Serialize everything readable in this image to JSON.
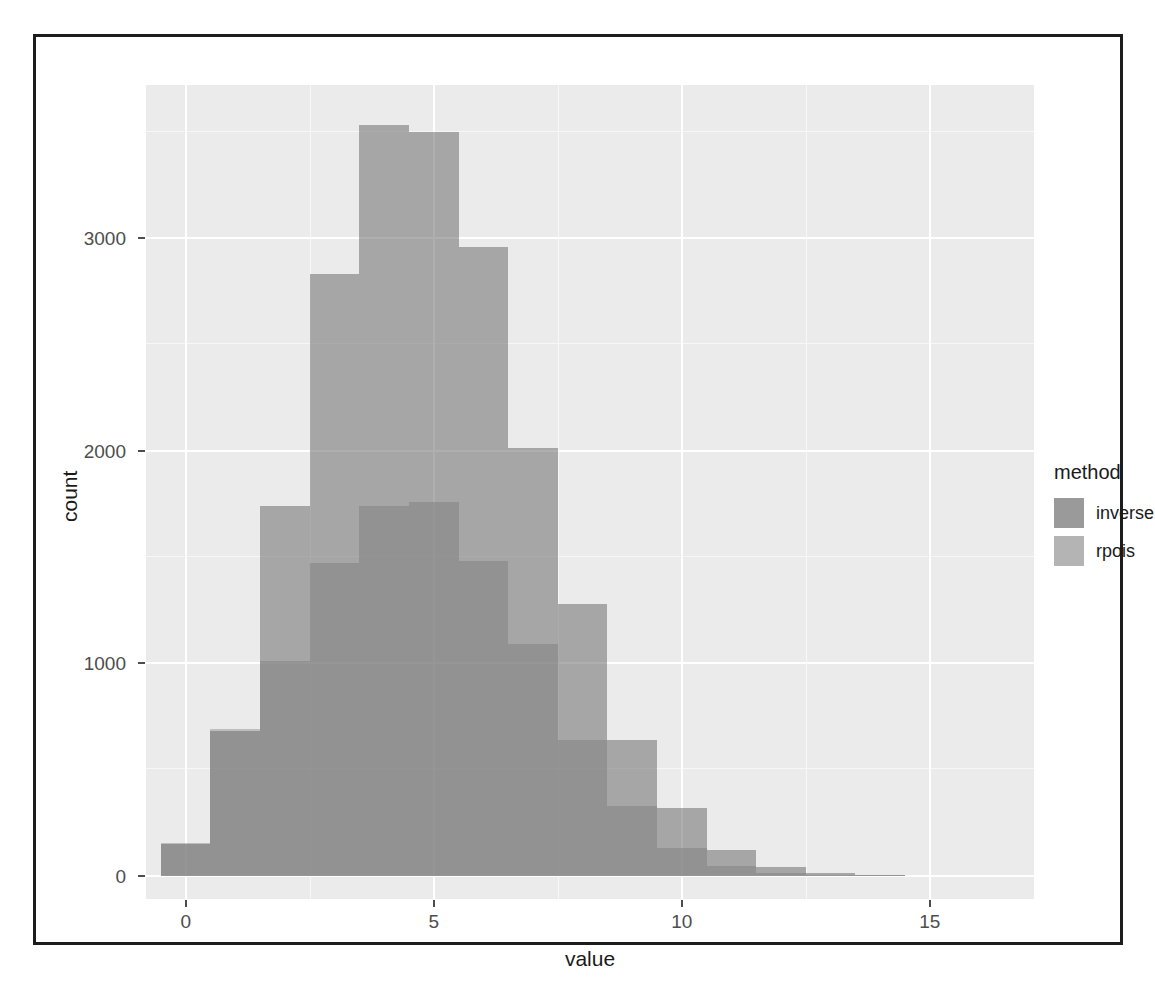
{
  "chart_data": {
    "type": "bar",
    "subtype": "overlapping-histogram",
    "title": "",
    "xlabel": "value",
    "ylabel": "count",
    "xlim": [
      -0.8,
      17.1
    ],
    "ylim": [
      -110,
      3720
    ],
    "xticks": [
      0,
      5,
      10,
      15
    ],
    "xtick_labels": [
      "0",
      "5",
      "10",
      "15"
    ],
    "yticks": [
      0,
      1000,
      2000,
      3000
    ],
    "ytick_labels": [
      "0",
      "1000",
      "2000",
      "3000"
    ],
    "grid": true,
    "grid_major_color": "#ffffff",
    "panel_background": "#ebebeb",
    "binwidth": 1,
    "bin_offset": -0.5,
    "legend_position": "right",
    "legend_title": "method",
    "series": [
      {
        "name": "inverse",
        "color": "#6e6e6e",
        "alpha": 0.55,
        "bins": [
          -0.5,
          0.5,
          1.5,
          2.5,
          3.5,
          4.5,
          5.5,
          6.5,
          7.5,
          8.5,
          9.5,
          10.5,
          11.5,
          12.5,
          13.5,
          14.5
        ],
        "values": [
          150,
          680,
          1740,
          2830,
          3530,
          3500,
          2960,
          2010,
          1280,
          640,
          320,
          120,
          40,
          12,
          4
        ]
      },
      {
        "name": "rpois",
        "color": "#969696",
        "alpha": 0.52,
        "bins": [
          -0.5,
          0.5,
          1.5,
          2.5,
          3.5,
          4.5,
          5.5,
          6.5,
          7.5,
          8.5,
          9.5,
          10.5,
          11.5,
          12.5,
          13.5,
          14.5
        ],
        "values": [
          155,
          690,
          1010,
          1470,
          1740,
          1760,
          1480,
          1090,
          640,
          330,
          130,
          45,
          14,
          5,
          2
        ]
      }
    ]
  },
  "axes": {
    "x_title": "value",
    "y_title": "count"
  },
  "legend": {
    "title": "method",
    "items": [
      {
        "label": "inverse",
        "color": "#9a9a9a"
      },
      {
        "label": "rpois",
        "color": "#b4b4b4"
      }
    ]
  }
}
